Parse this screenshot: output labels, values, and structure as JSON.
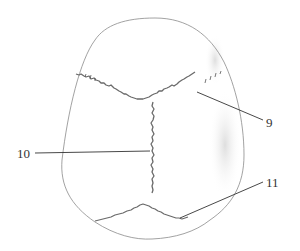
{
  "figure": {
    "labels": [
      {
        "id": "9",
        "text": "9",
        "x": 266,
        "y": 116
      },
      {
        "id": "10",
        "text": "10",
        "x": 17,
        "y": 148
      },
      {
        "id": "11",
        "text": "11",
        "x": 266,
        "y": 177
      }
    ],
    "colors": {
      "outline": "#8a8a8a",
      "suture": "#6a6a6a",
      "leader": "#333333",
      "shade": "#d8d8d8"
    }
  }
}
